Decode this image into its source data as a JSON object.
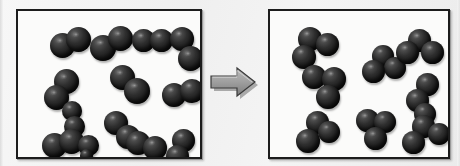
{
  "figure": {
    "background_color": "#f2f2f2",
    "panel_fill_color": "#fbfbfa",
    "panel_border_color": "#1c1c1c",
    "atom_color": "#1e1e1e",
    "arrow_color": "#9b9b9b",
    "arrow_label": "yields",
    "arrow_icon": "right-arrow-icon"
  },
  "reactants_panel": {
    "name": "reactants-container",
    "atoms_per_molecule": 2,
    "molecule_count": 13,
    "molecules": [
      {
        "id": "r1",
        "x": 32,
        "y": 22,
        "atoms": [
          {
            "dx": 0,
            "dy": 0,
            "d": 25
          },
          {
            "dx": 16,
            "dy": -6,
            "d": 25
          }
        ]
      },
      {
        "id": "r2",
        "x": 72,
        "y": 20,
        "atoms": [
          {
            "dx": 0,
            "dy": 4,
            "d": 26
          },
          {
            "dx": 18,
            "dy": -5,
            "d": 25
          }
        ]
      },
      {
        "id": "r3",
        "x": 114,
        "y": 18,
        "atoms": [
          {
            "dx": 0,
            "dy": 0,
            "d": 23
          },
          {
            "dx": 18,
            "dy": 0,
            "d": 23
          }
        ]
      },
      {
        "id": "r4",
        "x": 148,
        "y": 16,
        "atoms": [
          {
            "dx": 4,
            "dy": 0,
            "d": 24
          },
          {
            "dx": 12,
            "dy": 19,
            "d": 25
          }
        ]
      },
      {
        "id": "r5",
        "x": 26,
        "y": 58,
        "atoms": [
          {
            "dx": 10,
            "dy": 0,
            "d": 25
          },
          {
            "dx": 0,
            "dy": 16,
            "d": 25
          }
        ]
      },
      {
        "id": "r6",
        "x": 92,
        "y": 54,
        "atoms": [
          {
            "dx": 0,
            "dy": 0,
            "d": 25
          },
          {
            "dx": 14,
            "dy": 13,
            "d": 26
          }
        ]
      },
      {
        "id": "r7",
        "x": 144,
        "y": 68,
        "atoms": [
          {
            "dx": 0,
            "dy": 4,
            "d": 24
          },
          {
            "dx": 18,
            "dy": 0,
            "d": 24
          }
        ]
      },
      {
        "id": "r8",
        "x": 44,
        "y": 90,
        "atoms": [
          {
            "dx": 0,
            "dy": 0,
            "d": 20
          },
          {
            "dx": 2,
            "dy": 15,
            "d": 21
          }
        ]
      },
      {
        "id": "r9",
        "x": 84,
        "y": 100,
        "atoms": [
          {
            "dx": 2,
            "dy": 0,
            "d": 24
          },
          {
            "dx": 14,
            "dy": 14,
            "d": 24
          }
        ]
      },
      {
        "id": "r10",
        "x": 24,
        "y": 118,
        "atoms": [
          {
            "dx": 0,
            "dy": 4,
            "d": 25
          },
          {
            "dx": 17,
            "dy": 0,
            "d": 25
          }
        ]
      },
      {
        "id": "r11",
        "x": 108,
        "y": 120,
        "atoms": [
          {
            "dx": 0,
            "dy": 0,
            "d": 24
          },
          {
            "dx": 17,
            "dy": 5,
            "d": 24
          }
        ]
      },
      {
        "id": "r12",
        "x": 148,
        "y": 118,
        "atoms": [
          {
            "dx": 6,
            "dy": 0,
            "d": 23
          },
          {
            "dx": 0,
            "dy": 16,
            "d": 23
          }
        ]
      },
      {
        "id": "r13",
        "x": 60,
        "y": 118,
        "atoms": [
          {
            "dx": 0,
            "dy": 6,
            "d": 21
          },
          {
            "dx": 2,
            "dy": 20,
            "d": 13
          }
        ]
      }
    ]
  },
  "products_panel": {
    "name": "products-container",
    "atoms_per_molecule": 3,
    "molecule_count": 9,
    "molecules": [
      {
        "id": "p1",
        "x": 22,
        "y": 16,
        "atoms": [
          {
            "dx": 6,
            "dy": 0,
            "d": 24
          },
          {
            "dx": 24,
            "dy": 6,
            "d": 23
          },
          {
            "dx": 0,
            "dy": 18,
            "d": 24
          }
        ]
      },
      {
        "id": "p2",
        "x": 92,
        "y": 34,
        "atoms": [
          {
            "dx": 10,
            "dy": 0,
            "d": 22
          },
          {
            "dx": 22,
            "dy": 12,
            "d": 22
          },
          {
            "dx": 0,
            "dy": 15,
            "d": 23
          }
        ]
      },
      {
        "id": "p3",
        "x": 126,
        "y": 18,
        "atoms": [
          {
            "dx": 12,
            "dy": 0,
            "d": 23
          },
          {
            "dx": 0,
            "dy": 12,
            "d": 23
          },
          {
            "dx": 25,
            "dy": 12,
            "d": 23
          }
        ]
      },
      {
        "id": "p4",
        "x": 32,
        "y": 54,
        "atoms": [
          {
            "dx": 0,
            "dy": 0,
            "d": 24
          },
          {
            "dx": 20,
            "dy": 2,
            "d": 24
          },
          {
            "dx": 14,
            "dy": 20,
            "d": 24
          }
        ]
      },
      {
        "id": "p5",
        "x": 136,
        "y": 62,
        "atoms": [
          {
            "dx": 10,
            "dy": 0,
            "d": 23
          },
          {
            "dx": 0,
            "dy": 16,
            "d": 23
          },
          {
            "dx": 8,
            "dy": 30,
            "d": 22
          }
        ]
      },
      {
        "id": "p6",
        "x": 26,
        "y": 100,
        "atoms": [
          {
            "dx": 10,
            "dy": 0,
            "d": 23
          },
          {
            "dx": 22,
            "dy": 10,
            "d": 22
          },
          {
            "dx": 0,
            "dy": 18,
            "d": 24
          }
        ]
      },
      {
        "id": "p7",
        "x": 84,
        "y": 98,
        "atoms": [
          {
            "dx": 2,
            "dy": 0,
            "d": 23
          },
          {
            "dx": 20,
            "dy": 2,
            "d": 22
          },
          {
            "dx": 10,
            "dy": 18,
            "d": 23
          }
        ]
      },
      {
        "id": "p8",
        "x": 132,
        "y": 104,
        "atoms": [
          {
            "dx": 10,
            "dy": 0,
            "d": 23
          },
          {
            "dx": 26,
            "dy": 8,
            "d": 22
          },
          {
            "dx": 0,
            "dy": 16,
            "d": 23
          }
        ]
      },
      {
        "id": "p9",
        "x": 96,
        "y": 0,
        "atoms": [
          {
            "dx": 0,
            "dy": 0,
            "d": 0
          },
          {
            "dx": 0,
            "dy": 0,
            "d": 0
          },
          {
            "dx": 0,
            "dy": 0,
            "d": 0
          }
        ]
      }
    ]
  }
}
